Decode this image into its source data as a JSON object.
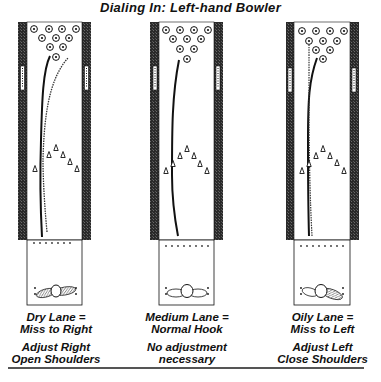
{
  "title": "Dialing In: Left-hand Bowler",
  "colors": {
    "ink": "#111111",
    "gutter": "#2a2a2a",
    "lane": "#ffffff"
  },
  "lanes": [
    {
      "id": "dry",
      "condition_line1": "Dry Lane =",
      "condition_line2": "Miss to Right",
      "advice_line1": "Adjust Right",
      "advice_line2": "Open Shoulders",
      "ball_path": "hooks early, misses to right"
    },
    {
      "id": "medium",
      "condition_line1": "Medium Lane =",
      "condition_line2": "Normal Hook",
      "advice_line1": "No adjustment",
      "advice_line2": "necessary",
      "ball_path": "normal hook into pocket"
    },
    {
      "id": "oily",
      "condition_line1": "Oily Lane =",
      "condition_line2": "Miss to Left",
      "advice_line1": "Adjust Left",
      "advice_line2": "Close Shoulders",
      "ball_path": "holds line, misses to left"
    }
  ]
}
